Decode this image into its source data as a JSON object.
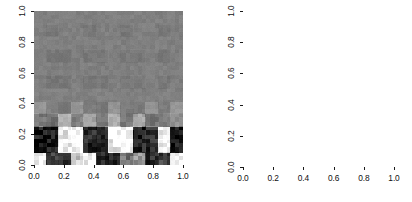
{
  "figure": {
    "background": "#ffffff",
    "foreground": "#1a1a1a",
    "panel_count": 2
  },
  "left_panel": {
    "name": "grayscale-image-plot",
    "x_ticks": [
      "0.0",
      "0.2",
      "0.4",
      "0.6",
      "0.8",
      "1.0"
    ],
    "y_ticks": [
      "0.0",
      "0.2",
      "0.4",
      "0.6",
      "0.8",
      "1.0"
    ],
    "x_tick_values": [
      0.0,
      0.2,
      0.4,
      0.6,
      0.8,
      1.0
    ],
    "y_tick_values": [
      0.0,
      0.2,
      0.4,
      0.6,
      0.8,
      1.0
    ],
    "xlabel": "",
    "ylabel": "",
    "title": ""
  },
  "right_panel": {
    "name": "contour-plot",
    "x_ticks": [
      "0.0",
      "0.2",
      "0.4",
      "0.6",
      "0.8",
      "1.0"
    ],
    "y_ticks": [
      "0.0",
      "0.2",
      "0.4",
      "0.6",
      "0.8",
      "1.0"
    ],
    "x_tick_values": [
      0.0,
      0.2,
      0.4,
      0.6,
      0.8,
      1.0
    ],
    "y_tick_values": [
      0.0,
      0.2,
      0.4,
      0.6,
      0.8,
      1.0
    ],
    "xlabel": "",
    "ylabel": "",
    "title": "",
    "contour_label": "0"
  },
  "chart_data": [
    {
      "type": "heatmap",
      "title": "",
      "xlabel": "",
      "ylabel": "",
      "xlim": [
        0.0,
        1.0
      ],
      "ylim": [
        0.0,
        1.0
      ],
      "xticks": [
        0.0,
        0.2,
        0.4,
        0.6,
        0.8,
        1.0
      ],
      "yticks": [
        0.0,
        0.2,
        0.4,
        0.6,
        0.8,
        1.0
      ],
      "grid": false,
      "legend": "none",
      "colormap": "grayscale",
      "colormap_range": [
        0,
        255
      ],
      "nx": 12,
      "ny": 12,
      "description": "Noisy checkerboard field: mid-gray background with faint darker checker blocks above y=0.2, and a strong high-contrast black/white alternating band below y=0.2.",
      "cell_x_centers": [
        0.0417,
        0.125,
        0.2083,
        0.2917,
        0.375,
        0.4583,
        0.5417,
        0.625,
        0.7083,
        0.7917,
        0.875,
        0.9583
      ],
      "cell_y_centers": [
        0.0417,
        0.125,
        0.2083,
        0.2917,
        0.375,
        0.4583,
        0.5417,
        0.625,
        0.7083,
        0.7917,
        0.875,
        0.9583
      ],
      "values": [
        [
          255,
          60,
          50,
          200,
          235,
          30,
          25,
          120,
          150,
          45,
          60,
          250
        ],
        [
          20,
          30,
          240,
          250,
          40,
          35,
          235,
          245,
          35,
          40,
          230,
          30
        ],
        [
          25,
          35,
          230,
          255,
          45,
          30,
          245,
          250,
          30,
          45,
          245,
          25
        ],
        [
          120,
          110,
          175,
          130,
          160,
          120,
          175,
          125,
          165,
          115,
          120,
          140
        ],
        [
          150,
          128,
          120,
          150,
          128,
          118,
          150,
          125,
          122,
          148,
          126,
          150
        ],
        [
          128,
          128,
          130,
          128,
          126,
          130,
          128,
          127,
          129,
          128,
          130,
          128
        ],
        [
          126,
          118,
          120,
          128,
          118,
          120,
          128,
          119,
          121,
          127,
          119,
          126
        ],
        [
          128,
          128,
          127,
          128,
          129,
          127,
          128,
          128,
          127,
          129,
          128,
          128
        ],
        [
          127,
          120,
          120,
          127,
          119,
          120,
          127,
          120,
          120,
          127,
          120,
          126
        ],
        [
          128,
          128,
          128,
          128,
          128,
          128,
          128,
          128,
          128,
          128,
          128,
          128
        ],
        [
          126,
          119,
          128,
          127,
          119,
          128,
          126,
          119,
          128,
          127,
          120,
          125
        ],
        [
          128,
          128,
          128,
          128,
          128,
          128,
          128,
          128,
          128,
          128,
          128,
          128
        ]
      ]
    },
    {
      "type": "contour",
      "title": "",
      "xlabel": "",
      "ylabel": "",
      "xlim": [
        0.0,
        1.0
      ],
      "ylim": [
        0.0,
        1.0
      ],
      "xticks": [
        0.0,
        0.2,
        0.4,
        0.6,
        0.8,
        1.0
      ],
      "yticks": [
        0.0,
        0.2,
        0.4,
        0.6,
        0.8,
        1.0
      ],
      "grid": false,
      "legend": "none",
      "labeled_levels": [
        "0"
      ],
      "periods_x": 6,
      "staircase_rows_y": [
        0.375,
        0.525,
        0.69,
        0.855,
        0.975
      ],
      "diamond_row_y": 0.25,
      "diamond_count": 7,
      "dense_peak_row_y": 0.11,
      "dense_peak_count": 7,
      "description": "Contour map of the same periodic field: staircase-shaped zero-level contours tiling the upper region (labelled 0), a row of small closed diamond contours near y=0.25, and tight concentric closed contours with dense packing at y between 0.0 and 0.2."
    }
  ]
}
